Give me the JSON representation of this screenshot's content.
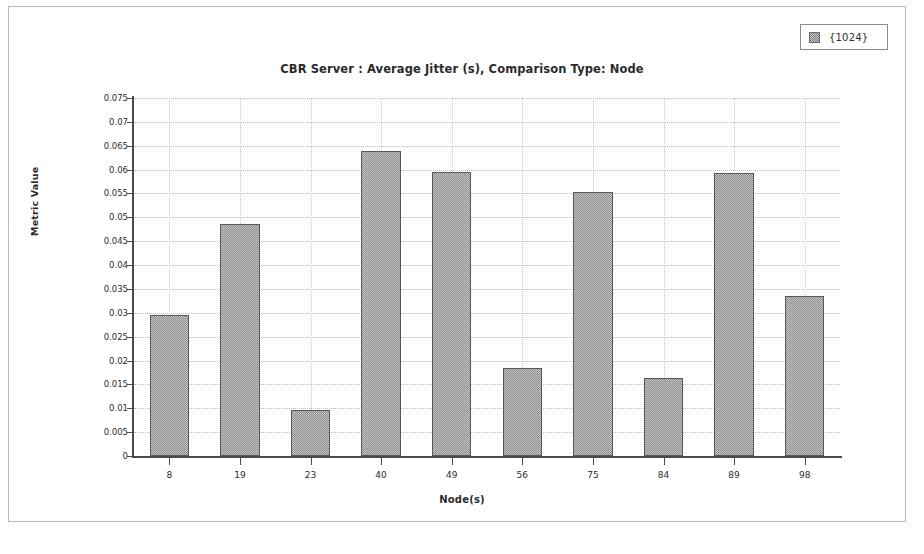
{
  "window": {
    "title": "CBR Server :  Average Jitter (s), Comparison Type: Node"
  },
  "legend": {
    "entries": [
      {
        "label": "{1024}",
        "swatch": "hatched-gray-swatch",
        "color": "#c6c6c6"
      }
    ]
  },
  "axes": {
    "ylabel": "Metric Value",
    "xlabel": "Node(s)"
  },
  "chart_data": {
    "type": "bar",
    "title": "CBR Server :  Average Jitter (s), Comparison Type: Node",
    "xlabel": "Node(s)",
    "ylabel": "Metric Value",
    "categories": [
      "8",
      "19",
      "23",
      "40",
      "49",
      "56",
      "75",
      "84",
      "89",
      "98"
    ],
    "series": [
      {
        "name": "{1024}",
        "values": [
          0.0295,
          0.0487,
          0.0096,
          0.0639,
          0.0595,
          0.0185,
          0.0553,
          0.0163,
          0.0593,
          0.0335
        ]
      }
    ],
    "ylim": [
      0,
      0.075
    ],
    "ytick_values": [
      0,
      0.005,
      0.01,
      0.015,
      0.02,
      0.025,
      0.03,
      0.035,
      0.04,
      0.045,
      0.05,
      0.055,
      0.06,
      0.065,
      0.07,
      0.075
    ],
    "ytick_labels": [
      "0",
      "0.005",
      "0.01",
      "0.015",
      "0.02",
      "0.025",
      "0.03",
      "0.035",
      "0.04",
      "0.045",
      "0.05",
      "0.055",
      "0.06",
      "0.065",
      "0.07",
      "0.075"
    ],
    "grid": true,
    "legend_position": "top-right",
    "bar_color": "#c6c6c6",
    "bar_edge_color": "#575757"
  }
}
